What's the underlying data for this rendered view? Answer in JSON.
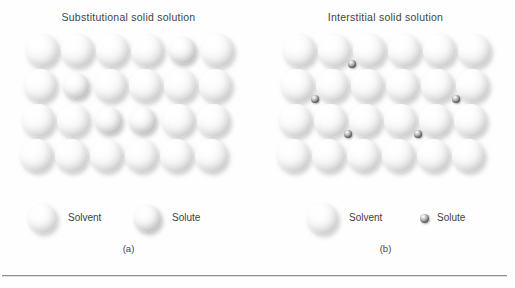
{
  "figure": {
    "background_color": "#fefefe",
    "rule_color": "#8e8e8e",
    "solvent_color": "#f2f2f2",
    "solute_substitutional_color": "#e2e2e2",
    "solute_interstitial_color": "#4a4a4a"
  },
  "panels": [
    {
      "id": "substitutional",
      "title": "Substitutional solid solution",
      "caption": "(a)",
      "legend": [
        {
          "icon": "large-sphere-icon",
          "label": "Solvent",
          "kind": "solvent"
        },
        {
          "icon": "medium-sphere-icon",
          "label": "Solute",
          "kind": "solute-substitutional"
        }
      ],
      "lattice": {
        "rows": 4,
        "cols": 6,
        "solvent_diameter": 33,
        "solute_diameter": 27,
        "atoms": [
          {
            "row": 1,
            "col": 1,
            "kind": "solvent"
          },
          {
            "row": 1,
            "col": 2,
            "kind": "solvent"
          },
          {
            "row": 1,
            "col": 3,
            "kind": "solvent"
          },
          {
            "row": 1,
            "col": 4,
            "kind": "solvent"
          },
          {
            "row": 1,
            "col": 5,
            "kind": "solute"
          },
          {
            "row": 1,
            "col": 6,
            "kind": "solvent"
          },
          {
            "row": 2,
            "col": 1,
            "kind": "solvent"
          },
          {
            "row": 2,
            "col": 2,
            "kind": "solute"
          },
          {
            "row": 2,
            "col": 3,
            "kind": "solvent"
          },
          {
            "row": 2,
            "col": 4,
            "kind": "solvent"
          },
          {
            "row": 2,
            "col": 5,
            "kind": "solvent"
          },
          {
            "row": 2,
            "col": 6,
            "kind": "solvent"
          },
          {
            "row": 3,
            "col": 1,
            "kind": "solvent"
          },
          {
            "row": 3,
            "col": 2,
            "kind": "solvent"
          },
          {
            "row": 3,
            "col": 3,
            "kind": "solute"
          },
          {
            "row": 3,
            "col": 4,
            "kind": "solute"
          },
          {
            "row": 3,
            "col": 5,
            "kind": "solvent"
          },
          {
            "row": 3,
            "col": 6,
            "kind": "solvent"
          },
          {
            "row": 4,
            "col": 1,
            "kind": "solvent"
          },
          {
            "row": 4,
            "col": 2,
            "kind": "solvent"
          },
          {
            "row": 4,
            "col": 3,
            "kind": "solvent"
          },
          {
            "row": 4,
            "col": 4,
            "kind": "solvent"
          },
          {
            "row": 4,
            "col": 5,
            "kind": "solvent"
          },
          {
            "row": 4,
            "col": 6,
            "kind": "solvent"
          }
        ]
      }
    },
    {
      "id": "interstitial",
      "title": "Interstitial solid solution",
      "caption": "(b)",
      "legend": [
        {
          "icon": "large-sphere-icon",
          "label": "Solvent",
          "kind": "solvent"
        },
        {
          "icon": "small-dark-sphere-icon",
          "label": "Solute",
          "kind": "solute-interstitial"
        }
      ],
      "lattice": {
        "rows": 4,
        "cols": 6,
        "solvent_diameter": 33,
        "interstitial_diameter": 8,
        "interstitials": [
          {
            "between_rows": "1-2",
            "between_cols": "2-3"
          },
          {
            "between_rows": "2-3",
            "between_cols": "1-2"
          },
          {
            "between_rows": "2-3",
            "between_cols": "5-6"
          },
          {
            "between_rows": "3-4",
            "between_cols": "2-3"
          },
          {
            "between_rows": "3-4",
            "between_cols": "4-5"
          }
        ]
      }
    }
  ]
}
